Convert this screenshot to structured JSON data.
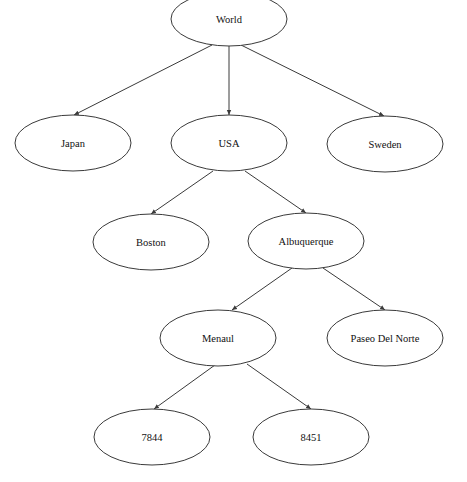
{
  "diagram": {
    "type": "tree",
    "nodes": [
      {
        "id": "world",
        "label": "World",
        "cx": 229,
        "cy": 19,
        "rx": 58,
        "ry": 27
      },
      {
        "id": "japan",
        "label": "Japan",
        "cx": 73,
        "cy": 143,
        "rx": 58,
        "ry": 28
      },
      {
        "id": "usa",
        "label": "USA",
        "cx": 229,
        "cy": 143,
        "rx": 58,
        "ry": 28
      },
      {
        "id": "sweden",
        "label": "Sweden",
        "cx": 385,
        "cy": 144,
        "rx": 58,
        "ry": 28
      },
      {
        "id": "boston",
        "label": "Boston",
        "cx": 151,
        "cy": 242,
        "rx": 58,
        "ry": 28
      },
      {
        "id": "albuquerque",
        "label": "Albuquerque",
        "cx": 306,
        "cy": 241,
        "rx": 58,
        "ry": 28
      },
      {
        "id": "menaul",
        "label": "Menaul",
        "cx": 218,
        "cy": 338,
        "rx": 58,
        "ry": 28
      },
      {
        "id": "paseo-del-norte",
        "label": "Paseo Del Norte",
        "cx": 385,
        "cy": 338,
        "rx": 58,
        "ry": 28
      },
      {
        "id": "n7844",
        "label": "7844",
        "cx": 152,
        "cy": 437,
        "rx": 58,
        "ry": 28
      },
      {
        "id": "n8451",
        "label": "8451",
        "cx": 311,
        "cy": 437,
        "rx": 58,
        "ry": 28
      }
    ],
    "edges": [
      {
        "from": "world",
        "to": "japan",
        "x1": 212,
        "y1": 45,
        "x2": 74,
        "y2": 115
      },
      {
        "from": "world",
        "to": "usa",
        "x1": 229,
        "y1": 46,
        "x2": 229,
        "y2": 115
      },
      {
        "from": "world",
        "to": "sweden",
        "x1": 241,
        "y1": 45,
        "x2": 384,
        "y2": 116
      },
      {
        "from": "usa",
        "to": "boston",
        "x1": 213,
        "y1": 171,
        "x2": 151,
        "y2": 214
      },
      {
        "from": "usa",
        "to": "albuquerque",
        "x1": 245,
        "y1": 171,
        "x2": 306,
        "y2": 213
      },
      {
        "from": "albuquerque",
        "to": "menaul",
        "x1": 292,
        "y1": 268,
        "x2": 232,
        "y2": 310
      },
      {
        "from": "albuquerque",
        "to": "paseo-del-norte",
        "x1": 323,
        "y1": 268,
        "x2": 385,
        "y2": 310
      },
      {
        "from": "menaul",
        "to": "n7844",
        "x1": 215,
        "y1": 365,
        "x2": 154,
        "y2": 409
      },
      {
        "from": "menaul",
        "to": "n8451",
        "x1": 247,
        "y1": 364,
        "x2": 311,
        "y2": 409
      }
    ]
  },
  "labels": {
    "world": "World",
    "japan": "Japan",
    "usa": "USA",
    "sweden": "Sweden",
    "boston": "Boston",
    "albuquerque": "Albuquerque",
    "menaul": "Menaul",
    "paseo_del_norte": "Paseo Del Norte",
    "n7844": "7844",
    "n8451": "8451"
  },
  "colors": {
    "stroke": "#3a3a3a",
    "background": "#ffffff",
    "text": "#111111"
  }
}
